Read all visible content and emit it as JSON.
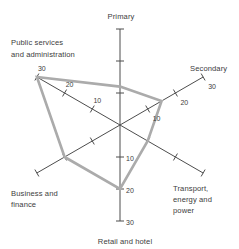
{
  "chart_data": {
    "type": "radar",
    "title": "",
    "r_axis": {
      "min": 0,
      "max": 30,
      "ticks": [
        10,
        20,
        30
      ]
    },
    "categories": [
      "Primary",
      "Secondary",
      "Transport, energy and power",
      "Retail and hotel",
      "Business and finance",
      "Public services and administration"
    ],
    "values": [
      12,
      15,
      10,
      20,
      20,
      30
    ],
    "axes": [
      {
        "label": "Primary",
        "label_lines": [
          "Primary"
        ],
        "show_tick_labels": false
      },
      {
        "label": "Secondary",
        "label_lines": [
          "Secondary"
        ],
        "show_tick_labels": true
      },
      {
        "label": "Transport, energy and power",
        "label_lines": [
          "Transport,",
          "energy and",
          "power"
        ],
        "show_tick_labels": false
      },
      {
        "label": "Retail and hotel",
        "label_lines": [
          "Retail and hotel"
        ],
        "show_tick_labels": true
      },
      {
        "label": "Business and finance",
        "label_lines": [
          "Business and",
          "finance"
        ],
        "show_tick_labels": false
      },
      {
        "label": "Public services and administration",
        "label_lines": [
          "Public services",
          "and administration"
        ],
        "show_tick_labels": true
      }
    ],
    "legend": null,
    "grid": false
  },
  "colors": {
    "background": "#ffffff",
    "axis_line": "#4d4d4d",
    "data_polygon": "#ababab",
    "text": "#3d3d3d"
  }
}
